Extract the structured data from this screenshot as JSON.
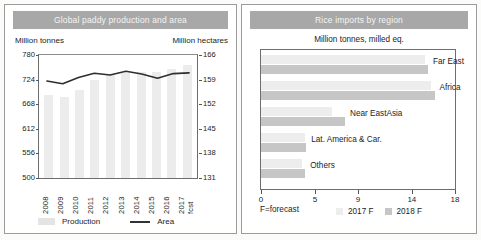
{
  "left_panel": {
    "title": "Global paddy production and area",
    "left_axis_caption": "Million tonnes",
    "right_axis_caption": "Million hectares",
    "legend": {
      "production": "Production",
      "area": "Area"
    }
  },
  "right_panel": {
    "title": "Rice imports by region",
    "subcaption": "Million tonnes, milled eq.",
    "footnote": "F=forecast",
    "legend": {
      "y2017": "2017 F",
      "y2018": "2018 F"
    }
  },
  "chart_data": [
    {
      "type": "bar",
      "title": "Global paddy production and area",
      "xlabel": "",
      "ylabel": "Million tonnes",
      "y2label": "Million hectares",
      "categories": [
        "2008",
        "2009",
        "2010",
        "2011",
        "2012",
        "2013",
        "2014",
        "2015",
        "2016",
        "2017 fcst"
      ],
      "ylim": [
        500,
        780
      ],
      "yticks": [
        500,
        556,
        612,
        668,
        724,
        780
      ],
      "y2lim": [
        131,
        166
      ],
      "y2ticks": [
        131,
        138,
        145,
        152,
        159,
        166
      ],
      "grid": false,
      "legend_position": "bottom",
      "series": [
        {
          "name": "Production",
          "axis": "left",
          "type": "bar",
          "values": [
            689,
            685,
            701,
            723,
            734,
            740,
            742,
            741,
            748,
            757
          ]
        },
        {
          "name": "Area",
          "axis": "right",
          "type": "line",
          "values": [
            158.6,
            157.8,
            159.6,
            160.8,
            160.3,
            161.4,
            160.6,
            159.4,
            160.7,
            160.9
          ]
        }
      ]
    },
    {
      "type": "bar",
      "orientation": "horizontal",
      "title": "Rice imports by region",
      "xlabel": "Million tonnes, milled eq.",
      "ylabel": "",
      "xlim": [
        0,
        18
      ],
      "xticks": [
        0,
        5,
        9,
        14,
        18
      ],
      "categories": [
        "Far East",
        "Africa",
        "Near EastAsia",
        "Lat. America & Car.",
        "Others"
      ],
      "legend_position": "bottom",
      "series": [
        {
          "name": "2017 F",
          "values": [
            15.2,
            15.8,
            6.6,
            4.1,
            3.8
          ]
        },
        {
          "name": "2018 F",
          "values": [
            15.5,
            16.1,
            7.8,
            4.2,
            4.1
          ]
        }
      ]
    }
  ]
}
